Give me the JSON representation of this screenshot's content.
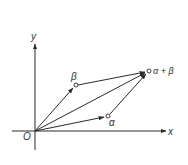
{
  "diagram": {
    "colors": {
      "line": "#2a2a2a",
      "text": "#333333",
      "background": "#ffffff"
    },
    "axes": {
      "x_label": "x",
      "y_label": "y",
      "origin_label": "O"
    },
    "points": [
      {
        "id": "alpha",
        "label": "α",
        "x": 108,
        "y": 116
      },
      {
        "id": "beta",
        "label": "β",
        "x": 76,
        "y": 85
      },
      {
        "id": "alpha-plus-beta",
        "label": "α + β",
        "x": 149,
        "y": 71
      }
    ],
    "vectors": [
      {
        "from": "O",
        "to": "alpha"
      },
      {
        "from": "O",
        "to": "beta"
      },
      {
        "from": "O",
        "to": "alpha-plus-beta"
      },
      {
        "from": "beta",
        "to": "alpha-plus-beta"
      },
      {
        "from": "alpha",
        "to": "alpha-plus-beta"
      }
    ]
  }
}
